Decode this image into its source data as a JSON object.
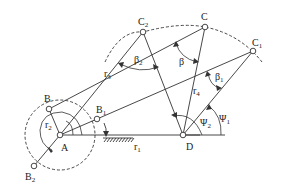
{
  "diagram": {
    "type": "four-bar linkage kinematic diagram",
    "background": "#ffffff",
    "stroke_color": "#333333",
    "points": {
      "A": {
        "label": "A",
        "x": 60,
        "y": 135
      },
      "D": {
        "label": "D",
        "x": 183,
        "y": 135
      },
      "B": {
        "label": "B",
        "x": 49,
        "y": 109
      },
      "B1": {
        "label": "B",
        "sub": "1",
        "x": 97,
        "y": 119
      },
      "B2": {
        "label": "B",
        "sub": "2",
        "x": 34,
        "y": 166
      },
      "C": {
        "label": "C",
        "x": 205,
        "y": 27
      },
      "C1": {
        "label": "C",
        "sub": "1",
        "x": 253,
        "y": 51
      },
      "C2": {
        "label": "C",
        "sub": "2",
        "x": 143,
        "y": 32
      }
    },
    "links": {
      "r1": {
        "label": "r",
        "sub": "1"
      },
      "r2": {
        "label": "r",
        "sub": "2"
      },
      "r3": {
        "label": "r",
        "sub": "3"
      },
      "r4": {
        "label": "r",
        "sub": "4"
      }
    },
    "angles": {
      "beta": {
        "label": "β"
      },
      "beta1": {
        "label": "β",
        "sub": "1"
      },
      "beta2": {
        "label": "β",
        "sub": "2"
      },
      "psi1": {
        "label": "Ψ",
        "sub": "1"
      },
      "psi2": {
        "label": "Ψ",
        "sub": "2"
      }
    }
  }
}
